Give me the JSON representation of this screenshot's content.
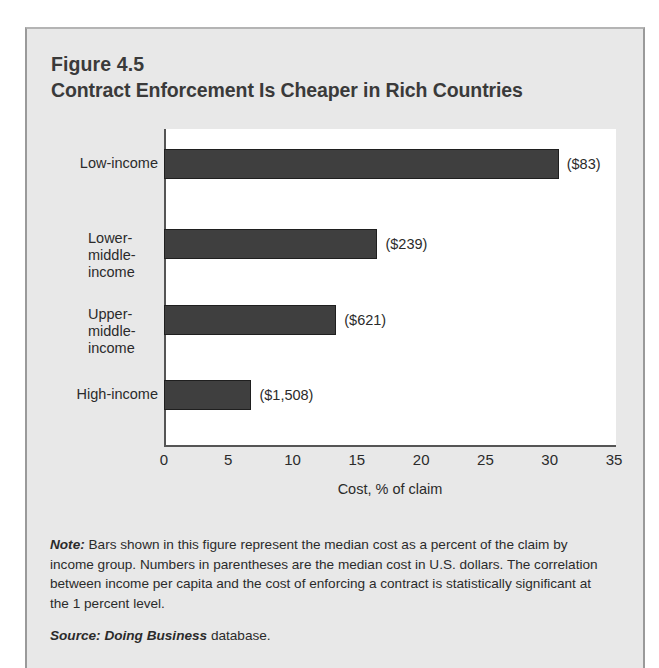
{
  "figure": {
    "number": "Figure 4.5",
    "title": "Contract Enforcement Is Cheaper in Rich Countries"
  },
  "chart_data": {
    "type": "bar",
    "orientation": "horizontal",
    "title": "Contract Enforcement Is Cheaper in Rich Countries",
    "categories": [
      "Low-income",
      "Lower-middle-income",
      "Upper-middle-income",
      "High-income"
    ],
    "values": [
      30.7,
      16.6,
      13.4,
      6.8
    ],
    "value_labels": [
      "($83)",
      "($239)",
      "($621)",
      "($1,508)"
    ],
    "xlabel": "Cost, % of claim",
    "ylabel": "",
    "xlim": [
      0,
      35
    ],
    "xticks": [
      0,
      5,
      10,
      15,
      20,
      25,
      30,
      35
    ],
    "xtick_labels": [
      "0",
      "5",
      "10",
      "15",
      "20",
      "25",
      "30",
      "35"
    ],
    "grid": false,
    "legend": false,
    "bar_color": "#3f3f3f",
    "plot_background": "#ffffff",
    "panel_background": "#e8e8e8"
  },
  "note": {
    "lead": "Note:",
    "body": " Bars shown in this figure represent the median cost as a percent of the claim by income group. Numbers in parentheses are the median cost in U.S. dollars. The correlation between income per capita and the cost of enforcing a contract is statistically significant at the 1 percent level."
  },
  "source": {
    "lead": "Source: Doing Business",
    "body": " database."
  }
}
